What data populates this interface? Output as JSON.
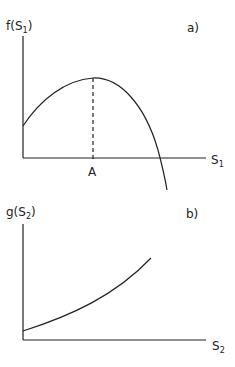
{
  "panel_a": {
    "y_label": "f(S",
    "y_label_sub": "1",
    "y_label_close": ")",
    "x_label": "S",
    "x_label_sub": "1",
    "tag": "a)",
    "point_label": "A",
    "curve": "concave, rises from positive intercept to maximum at A, then falls below zero"
  },
  "panel_b": {
    "y_label": "g(S",
    "y_label_sub": "2",
    "y_label_close": ")",
    "x_label": "S",
    "x_label_sub": "2",
    "tag": "b)",
    "curve": "convex, increasing from positive intercept"
  },
  "colors": {
    "line": "#222222",
    "background": "#ffffff"
  }
}
